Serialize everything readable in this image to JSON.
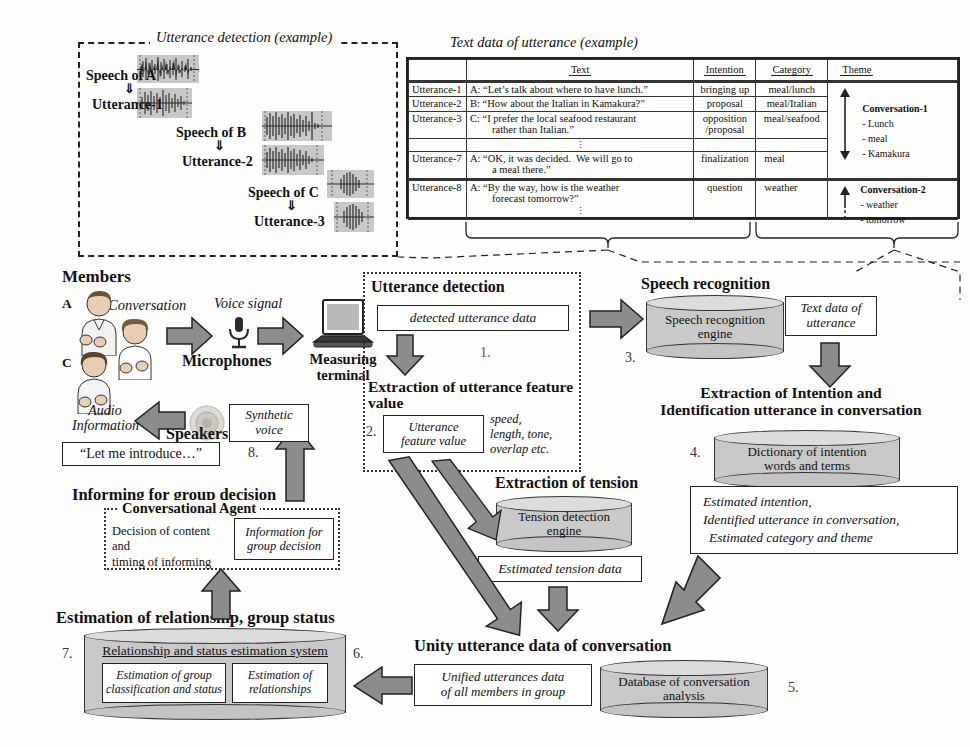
{
  "panels": {
    "utterance_detection_example": {
      "title": "Utterance detection (example)",
      "rows": [
        {
          "speech": "Speech of A",
          "arrow": "⇓",
          "utterance": "Utterance-1"
        },
        {
          "speech": "Speech of B",
          "arrow": "⇓",
          "utterance": "Utterance-2"
        },
        {
          "speech": "Speech of C",
          "arrow": "⇓",
          "utterance": "Utterance-3"
        }
      ]
    },
    "text_data_example": {
      "title": "Text data of utterance (example)",
      "columns": [
        "",
        "Text",
        "Intention",
        "Category",
        "Theme"
      ],
      "rows": [
        {
          "id": "Utterance-1",
          "text": "A: “Let’s talk about where to have lunch.”",
          "intention": "bringing up",
          "category": "meal/lunch"
        },
        {
          "id": "Utterance-2",
          "text": "B: “How about the Italian in Kamakura?”",
          "intention": "proposal",
          "category": "meal/Italian"
        },
        {
          "id": "Utterance-3",
          "text": "C: “I prefer the local seafood restaurant rather than Italian.”",
          "intention": "opposition /proposal",
          "category": "meal/seafood"
        },
        {
          "id": "",
          "text": "⋮",
          "intention": "",
          "category": ""
        },
        {
          "id": "Utterance-7",
          "text": "A: “OK, it was decided.  We will go to a meal there.”",
          "intention": "finalization",
          "category": "meal"
        },
        {
          "id": "Utterance-8",
          "text": "A: “By the way, how is the weather forecast tomorrow?”",
          "intention": "question",
          "category": "weather"
        },
        {
          "id": "",
          "text": "⋮",
          "intention": "",
          "category": ""
        }
      ],
      "themes": [
        {
          "name": "Conversation-1",
          "items": [
            "- Lunch",
            "- meal",
            "- Kamakura"
          ]
        },
        {
          "name": "Conversation-2",
          "items": [
            "- weather",
            "- tomorrow"
          ]
        }
      ]
    }
  },
  "flow": {
    "members_label": "Members",
    "member_a": "A",
    "member_b": "B",
    "member_c": "C",
    "conversation_label": "Conversation",
    "voice_signal_label": "Voice signal",
    "microphones_label": "Microphones",
    "measuring_terminal_label": "Measuring terminal",
    "audio_information_label": "Audio Information",
    "speakers_label": "Speakers",
    "synthetic_voice_label": "Synthetic voice",
    "let_me_introduce": "“Let me introduce…”",
    "utterance_detection_title": "Utterance detection",
    "detected_utterance_data": "detected utterance data",
    "extraction_feature_title": "Extraction of utterance feature value",
    "utterance_feature_value": "Utterance feature value",
    "feature_note": "speed, length, tone, overlap etc.",
    "speech_recognition_title": "Speech recognition",
    "speech_recognition_engine": "Speech recognition engine",
    "text_data_of_utterance": "Text data of utterance",
    "extraction_intention_title": "Extraction of Intention and Identification utterance in conversation",
    "dictionary_of_intention": "Dictionary of intention words and terms",
    "estimated_intention_box": "Estimated intention, Identified utterance in conversation, Estimated  category and theme",
    "estimated_intention_line1": "Estimated intention,",
    "estimated_intention_line2": "Identified utterance in conversation,",
    "estimated_intention_line3": "Estimated  category and theme",
    "extraction_tension_title": "Extraction of tension",
    "tension_detection_engine": "Tension detection engine",
    "estimated_tension_data": "Estimated tension data",
    "unity_utterance_title": "Unity utterance data of conversation",
    "unified_utterances_data": "Unified utterances data of all members in group",
    "database_of_conversation": "Database of conversation analysis",
    "estimation_relationship_title": "Estimation of relationship, group status",
    "relationship_system": "Relationship and status estimation system",
    "estimation_group_class": "Estimation of group classification and status",
    "estimation_relationships": "Estimation of relationships",
    "informing_title": "Informing for group decision",
    "conversational_agent": "Conversational Agent",
    "decision_of_content": "Decision of content and timing of informing",
    "information_for_group_decision": "Information for group decision",
    "steps": {
      "s1": "1.",
      "s2": "2.",
      "s3": "3.",
      "s4": "4.",
      "s5": "5.",
      "s6": "6.",
      "s7": "7.",
      "s8": "8."
    }
  },
  "colors": {
    "arrow_fill": "#8c8c8c",
    "cylinder_fill": "#c9c9c9",
    "waveform_bg": "#c8c8c8",
    "line": "#222222"
  }
}
